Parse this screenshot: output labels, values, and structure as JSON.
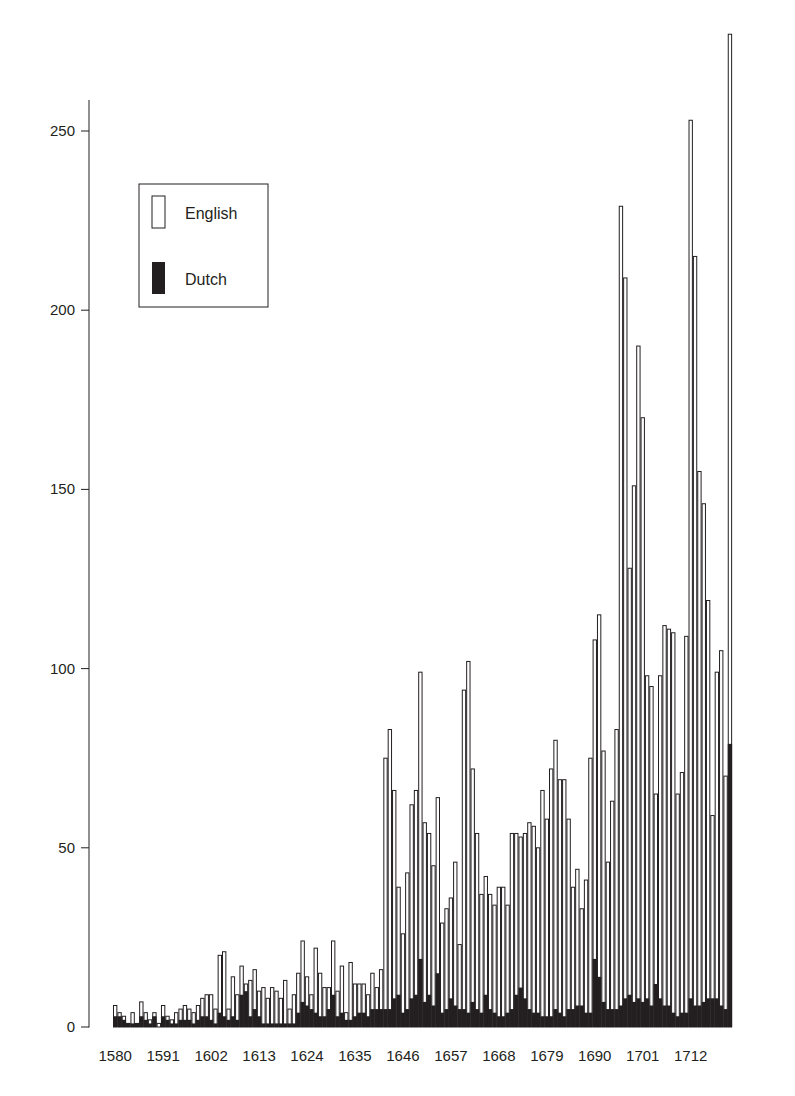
{
  "chart_data": {
    "type": "bar",
    "stacking": "overlay",
    "title": "",
    "xlabel": "",
    "ylabel": "",
    "ylim": [
      0,
      275
    ],
    "yticks": [
      0,
      50,
      100,
      150,
      200,
      250
    ],
    "xtick_labels": [
      "1580",
      "1591",
      "1602",
      "1613",
      "1624",
      "1635",
      "1646",
      "1657",
      "1668",
      "1679",
      "1690",
      "1701",
      "1712"
    ],
    "grid": false,
    "legend": {
      "position": "upper-left",
      "entries": [
        {
          "label": "English",
          "style": "outline",
          "color": "#ffffff"
        },
        {
          "label": "Dutch",
          "style": "filled",
          "color": "#231f20"
        }
      ]
    },
    "x_start": 1580,
    "series": [
      {
        "name": "English",
        "values": [
          6,
          4,
          3,
          1,
          4,
          1,
          7,
          4,
          2,
          4,
          1,
          6,
          3,
          2,
          4,
          5,
          6,
          5,
          4,
          6,
          8,
          9,
          9,
          5,
          20,
          21,
          5,
          14,
          9,
          17,
          12,
          13,
          16,
          10,
          11,
          8,
          11,
          10,
          8,
          13,
          5,
          9,
          15,
          24,
          14,
          9,
          22,
          15,
          11,
          11,
          24,
          10,
          17,
          4,
          18,
          12,
          12,
          12,
          9,
          15,
          11,
          16,
          75,
          83,
          66,
          39,
          26,
          43,
          62,
          66,
          99,
          57,
          54,
          45,
          64,
          29,
          33,
          36,
          46,
          23,
          94,
          102,
          72,
          54,
          37,
          42,
          37,
          34,
          39,
          39,
          34,
          54,
          54,
          53,
          54,
          57,
          56,
          50,
          66,
          58,
          72,
          80,
          69,
          69,
          58,
          39,
          44,
          33,
          41,
          75,
          108,
          115,
          77,
          46,
          63,
          83,
          229,
          209,
          128,
          151,
          190,
          170,
          98,
          95,
          65,
          98,
          112,
          111,
          110,
          65,
          71,
          109,
          253,
          215,
          155,
          146,
          119,
          59,
          99,
          105,
          70,
          277
        ],
        "_note_end": ""
      },
      {
        "name": "Dutch",
        "values": [
          3,
          3,
          2,
          1,
          1,
          1,
          3,
          2,
          1,
          3,
          0,
          3,
          2,
          1,
          1,
          2,
          2,
          2,
          1,
          2,
          3,
          3,
          2,
          1,
          4,
          3,
          2,
          3,
          2,
          9,
          10,
          3,
          5,
          3,
          1,
          1,
          1,
          1,
          1,
          1,
          1,
          1,
          4,
          7,
          6,
          5,
          4,
          3,
          3,
          5,
          9,
          3,
          4,
          2,
          2,
          3,
          4,
          4,
          3,
          5,
          5,
          5,
          5,
          5,
          8,
          9,
          4,
          5,
          8,
          9,
          19,
          7,
          9,
          6,
          15,
          4,
          5,
          8,
          6,
          5,
          5,
          4,
          7,
          5,
          4,
          9,
          5,
          4,
          3,
          3,
          4,
          5,
          9,
          11,
          8,
          5,
          4,
          4,
          3,
          3,
          3,
          5,
          4,
          3,
          5,
          5,
          6,
          6,
          4,
          4,
          19,
          14,
          7,
          5,
          5,
          5,
          6,
          8,
          9,
          7,
          8,
          7,
          8,
          6,
          12,
          8,
          6,
          6,
          4,
          3,
          4,
          4,
          8,
          6,
          6,
          7,
          8,
          8,
          8,
          6,
          5,
          79
        ]
      }
    ]
  }
}
